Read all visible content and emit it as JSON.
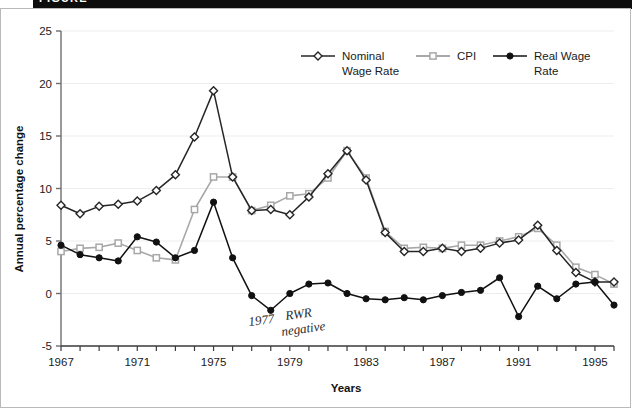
{
  "figure": {
    "header_label": "FIGURE",
    "frame_color": "#b9b9b9",
    "header_band_color": "#0d0d0d"
  },
  "annotation": {
    "line1": "1977",
    "line2": "RWR",
    "line3": "negative",
    "color": "#2b2b2b"
  },
  "chart_data": {
    "type": "line",
    "title": "",
    "subtitle": "",
    "xlabel": "Years",
    "ylabel": "Annual percentage change",
    "xlim": [
      1967,
      1996
    ],
    "ylim": [
      -5,
      25
    ],
    "yticks": [
      -5,
      0,
      5,
      10,
      15,
      20,
      25
    ],
    "ytick_labels": [
      "-5",
      "0",
      "5",
      "10",
      "15",
      "20",
      "25"
    ],
    "xticks": [
      1967,
      1968,
      1969,
      1970,
      1971,
      1972,
      1973,
      1974,
      1975,
      1976,
      1977,
      1978,
      1979,
      1980,
      1981,
      1982,
      1983,
      1984,
      1985,
      1986,
      1987,
      1988,
      1989,
      1990,
      1991,
      1992,
      1993,
      1994,
      1995,
      1996
    ],
    "xtick_labels_shown": [
      "1967",
      "1971",
      "1975",
      "1979",
      "1983",
      "1987",
      "1991",
      "1995"
    ],
    "xtick_labels_shown_years": [
      1967,
      1971,
      1975,
      1979,
      1983,
      1987,
      1991,
      1995
    ],
    "grid": true,
    "grid_axis": "y",
    "grid_color": "#ededed",
    "legend_position": "top-center",
    "x": [
      1967,
      1968,
      1969,
      1970,
      1971,
      1972,
      1973,
      1974,
      1975,
      1976,
      1977,
      1978,
      1979,
      1980,
      1981,
      1982,
      1983,
      1984,
      1985,
      1986,
      1987,
      1988,
      1989,
      1990,
      1991,
      1992,
      1993,
      1994,
      1995,
      1996
    ],
    "series": [
      {
        "name": "Nominal Wage Rate",
        "color": "#262626",
        "marker": "diamond-open",
        "values": [
          8.4,
          7.6,
          8.3,
          8.5,
          8.8,
          9.8,
          11.3,
          14.9,
          19.3,
          11.1,
          7.9,
          8.0,
          7.5,
          9.2,
          11.4,
          13.6,
          10.8,
          5.8,
          4.0,
          4.0,
          4.3,
          4.0,
          4.3,
          4.8,
          5.1,
          6.5,
          4.1,
          2.0,
          1.1,
          1.1
        ]
      },
      {
        "name": "CPI",
        "color": "#a8a8a8",
        "marker": "square-open",
        "values": [
          4.0,
          4.3,
          4.4,
          4.8,
          4.1,
          3.4,
          3.2,
          8.0,
          11.1,
          11.1,
          7.9,
          8.4,
          9.3,
          9.5,
          11.0,
          13.6,
          11.0,
          5.9,
          4.3,
          4.4,
          4.3,
          4.6,
          4.6,
          5.0,
          5.4,
          6.2,
          4.6,
          2.5,
          1.8,
          0.9
        ]
      },
      {
        "name": "Real Wage Rate",
        "color": "#111111",
        "marker": "circle-filled",
        "values": [
          4.6,
          3.7,
          3.4,
          3.1,
          5.4,
          4.9,
          3.4,
          4.1,
          8.7,
          3.4,
          -0.2,
          -1.6,
          0.0,
          0.9,
          1.0,
          0.0,
          -0.5,
          -0.6,
          -0.4,
          -0.6,
          -0.2,
          0.1,
          0.3,
          1.5,
          -2.2,
          0.7,
          -0.5,
          0.9,
          1.1,
          -1.1
        ]
      }
    ]
  },
  "legend": {
    "items": [
      {
        "label_line1": "Nominal",
        "label_line2": "Wage Rate",
        "color": "#262626",
        "marker": "diamond-open"
      },
      {
        "label_line1": "CPI",
        "label_line2": "",
        "color": "#a8a8a8",
        "marker": "square-open"
      },
      {
        "label_line1": "Real Wage",
        "label_line2": "Rate",
        "color": "#111111",
        "marker": "circle-filled"
      }
    ]
  }
}
